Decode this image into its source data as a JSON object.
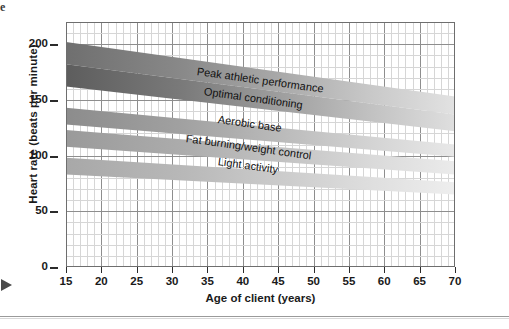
{
  "page": {
    "corner_glyph": "e",
    "margin_arrow_icon": "right-triangle-icon"
  },
  "chart_data": {
    "type": "area",
    "title": "",
    "xlabel": "Age of client (years)",
    "ylabel": "Heart rate (beats per minute)",
    "xlim": [
      15,
      70
    ],
    "ylim": [
      0,
      220
    ],
    "xticks": [
      15,
      20,
      25,
      30,
      35,
      40,
      45,
      50,
      55,
      60,
      65,
      70
    ],
    "yticks": [
      0,
      50,
      100,
      150,
      200
    ],
    "grid": true,
    "grid_minor_x_step": 1,
    "grid_minor_y_step": 10,
    "legend": "none",
    "x": [
      15,
      70
    ],
    "series": [
      {
        "name": "Peak athletic performance",
        "upper": [
          202,
          153
        ],
        "lower": [
          182,
          137
        ],
        "color": "#6f6f6f"
      },
      {
        "name": "Optimal conditioning",
        "upper": [
          182,
          137
        ],
        "lower": [
          162,
          122
        ],
        "color": "#5d5d5d"
      },
      {
        "name": "Aerobic base",
        "upper": [
          143,
          110
        ],
        "lower": [
          128,
          99
        ],
        "color": "#8c8c8c"
      },
      {
        "name": "Fat burning/weight control",
        "upper": [
          123,
          95
        ],
        "lower": [
          108,
          83
        ],
        "color": "#9a9a9a"
      },
      {
        "name": "Light activity",
        "upper": [
          98,
          76
        ],
        "lower": [
          83,
          65
        ],
        "color": "#a8a8a8"
      }
    ],
    "annotations": [
      {
        "text": "Peak athletic performance",
        "x": 33.5,
        "y": 176
      },
      {
        "text": "Optimal conditioning",
        "x": 34.5,
        "y": 158
      },
      {
        "text": "Aerobic base",
        "x": 36.5,
        "y": 133
      },
      {
        "text": "Fat burning/weight control",
        "x": 32.0,
        "y": 116
      },
      {
        "text": "Light activity",
        "x": 36.5,
        "y": 95
      }
    ]
  }
}
